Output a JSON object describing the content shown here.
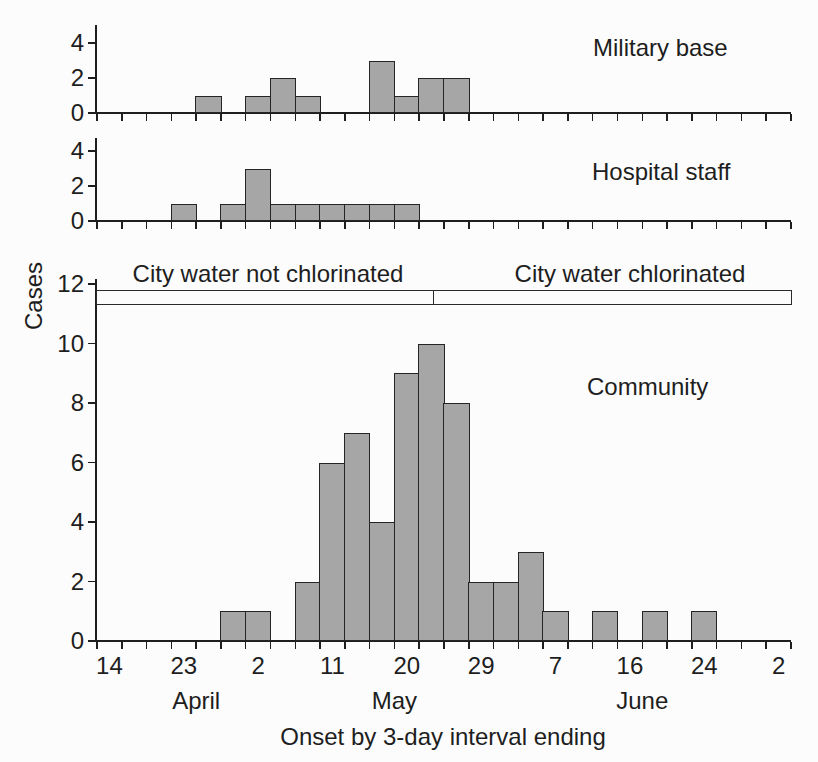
{
  "figure": {
    "ylabel": "Cases",
    "xlabel": "Onset by 3-day interval ending",
    "background": "#fcfcfc",
    "text_color": "#1e1e1e"
  },
  "colors": {
    "bar_fill": "#a6a6a6",
    "bar_stroke": "#252525",
    "axis": "#1e1e1e"
  },
  "annotation_bar": {
    "left_label": "City water not chlorinated",
    "right_label": "City water chlorinated",
    "divider_fraction": 0.484
  },
  "x_axis": {
    "n_intervals": 28,
    "interval_days": 3,
    "tick_labels": [
      {
        "cell": 0,
        "label": "14"
      },
      {
        "cell": 3,
        "label": "23"
      },
      {
        "cell": 6,
        "label": "2"
      },
      {
        "cell": 9,
        "label": "11"
      },
      {
        "cell": 12,
        "label": "20"
      },
      {
        "cell": 15,
        "label": "29"
      },
      {
        "cell": 18,
        "label": "7"
      },
      {
        "cell": 21,
        "label": "16"
      },
      {
        "cell": 24,
        "label": "24"
      },
      {
        "cell": 27,
        "label": "2"
      }
    ],
    "months": [
      {
        "label": "April",
        "boundary_index": 4
      },
      {
        "label": "May",
        "boundary_index": 12
      },
      {
        "label": "June",
        "boundary_index": 22
      }
    ]
  },
  "chart_data": [
    {
      "type": "bar",
      "title": "Military base",
      "ylim": [
        0,
        5
      ],
      "yticks": [
        0,
        2,
        4
      ],
      "values": [
        0,
        0,
        0,
        0,
        1,
        0,
        1,
        2,
        1,
        0,
        0,
        3,
        1,
        2,
        2,
        0,
        0,
        0,
        0,
        0,
        0,
        0,
        0,
        0,
        0,
        0,
        0,
        0
      ]
    },
    {
      "type": "bar",
      "title": "Hospital staff",
      "ylim": [
        0,
        5
      ],
      "yticks": [
        0,
        2,
        4
      ],
      "values": [
        0,
        0,
        0,
        1,
        0,
        1,
        3,
        1,
        1,
        1,
        1,
        1,
        1,
        0,
        0,
        0,
        0,
        0,
        0,
        0,
        0,
        0,
        0,
        0,
        0,
        0,
        0,
        0
      ]
    },
    {
      "type": "bar",
      "title": "Community",
      "ylim": [
        0,
        12.2
      ],
      "yticks": [
        0,
        2,
        4,
        6,
        8,
        10,
        12
      ],
      "values": [
        0,
        0,
        0,
        0,
        0,
        1,
        1,
        0,
        2,
        6,
        7,
        4,
        9,
        10,
        8,
        2,
        2,
        3,
        1,
        0,
        1,
        0,
        1,
        0,
        1,
        0,
        0,
        0
      ]
    }
  ]
}
